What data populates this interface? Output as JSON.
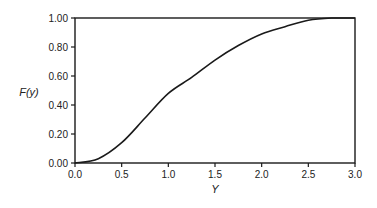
{
  "chart_data": {
    "type": "line",
    "title": "",
    "xlabel": "Y",
    "ylabel": "F(y)",
    "xlim": [
      0,
      3
    ],
    "ylim": [
      0,
      1
    ],
    "grid": false,
    "legend": null,
    "x_ticks": [
      "0.0",
      "0.5",
      "1.0",
      "1.5",
      "2.0",
      "2.5",
      "3.0"
    ],
    "y_ticks": [
      "0.00",
      "0.20",
      "0.40",
      "0.60",
      "0.80",
      "1.00"
    ],
    "series": [
      {
        "name": "F(y)",
        "color": "#1a1a1a",
        "x": [
          0,
          0.25,
          0.5,
          0.75,
          1.0,
          1.25,
          1.5,
          1.75,
          2.0,
          2.25,
          2.5,
          2.75,
          3.0
        ],
        "values": [
          0,
          0.03,
          0.14,
          0.31,
          0.48,
          0.59,
          0.71,
          0.81,
          0.89,
          0.94,
          0.985,
          1.0,
          1.0
        ]
      }
    ]
  },
  "colors": {
    "axis": "#1a1a1a",
    "text": "#222222",
    "background": "#ffffff"
  }
}
